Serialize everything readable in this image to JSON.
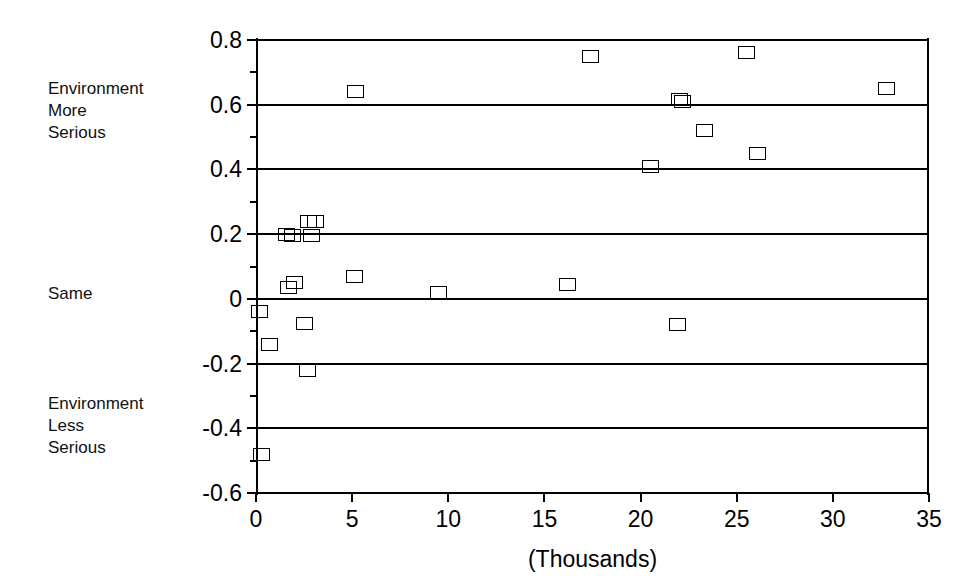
{
  "axis_labels": {
    "left_categories": [
      {
        "id": "more",
        "text": "Environment\nMore\nSerious"
      },
      {
        "id": "same",
        "text": "Same"
      },
      {
        "id": "less",
        "text": "Environment\nLess\nSerious"
      }
    ]
  },
  "chart_data": {
    "type": "scatter",
    "title": "",
    "xlabel": "(Thousands)",
    "ylabel": "",
    "xlim": [
      0,
      35
    ],
    "ylim": [
      -0.6,
      0.8
    ],
    "grid": true,
    "legend": "none",
    "marker": "open-square",
    "marker_color": "#000000",
    "xticks": [
      0,
      5,
      10,
      15,
      20,
      25,
      30,
      35
    ],
    "xticklabels": [
      "0",
      "5",
      "10",
      "15",
      "20",
      "25",
      "30",
      "35"
    ],
    "yticks": [
      -0.6,
      -0.4,
      -0.2,
      0,
      0.2,
      0.4,
      0.6,
      0.8
    ],
    "yticklabels": [
      "-0.6",
      "-0.4",
      "-0.2",
      "0",
      "0.2",
      "0.4",
      "0.6",
      "0.8"
    ],
    "y_category_annotations": [
      {
        "value": 0.62,
        "label": "Environment More Serious"
      },
      {
        "value": 0.0,
        "label": "Same"
      },
      {
        "value": -0.45,
        "label": "Environment Less Serious"
      }
    ],
    "x": [
      0.2,
      0.3,
      0.7,
      1.6,
      1.7,
      1.9,
      2.0,
      2.5,
      2.7,
      2.75,
      2.9,
      3.1,
      5.1,
      5.2,
      9.5,
      16.2,
      17.4,
      20.5,
      21.9,
      22.0,
      22.2,
      23.3,
      25.5,
      26.1,
      32.8
    ],
    "y": [
      -0.04,
      -0.48,
      -0.14,
      0.2,
      0.035,
      0.195,
      0.05,
      -0.075,
      -0.22,
      0.24,
      0.195,
      0.24,
      0.07,
      0.64,
      0.02,
      0.045,
      0.75,
      0.41,
      -0.08,
      0.615,
      0.61,
      0.52,
      0.76,
      0.45,
      0.65
    ],
    "points": [
      {
        "x": 0.2,
        "y": -0.04
      },
      {
        "x": 0.3,
        "y": -0.48
      },
      {
        "x": 0.7,
        "y": -0.14
      },
      {
        "x": 1.6,
        "y": 0.2
      },
      {
        "x": 1.7,
        "y": 0.035
      },
      {
        "x": 1.9,
        "y": 0.195
      },
      {
        "x": 2.0,
        "y": 0.05
      },
      {
        "x": 2.5,
        "y": -0.075
      },
      {
        "x": 2.7,
        "y": -0.22
      },
      {
        "x": 2.75,
        "y": 0.24
      },
      {
        "x": 2.9,
        "y": 0.195
      },
      {
        "x": 3.1,
        "y": 0.24
      },
      {
        "x": 5.1,
        "y": 0.07
      },
      {
        "x": 5.2,
        "y": 0.64
      },
      {
        "x": 9.5,
        "y": 0.02
      },
      {
        "x": 16.2,
        "y": 0.045
      },
      {
        "x": 17.4,
        "y": 0.75
      },
      {
        "x": 20.5,
        "y": 0.41
      },
      {
        "x": 21.9,
        "y": -0.08
      },
      {
        "x": 22.0,
        "y": 0.615
      },
      {
        "x": 22.2,
        "y": 0.61
      },
      {
        "x": 23.3,
        "y": 0.52
      },
      {
        "x": 25.5,
        "y": 0.76
      },
      {
        "x": 26.1,
        "y": 0.45
      },
      {
        "x": 32.8,
        "y": 0.65
      }
    ]
  }
}
